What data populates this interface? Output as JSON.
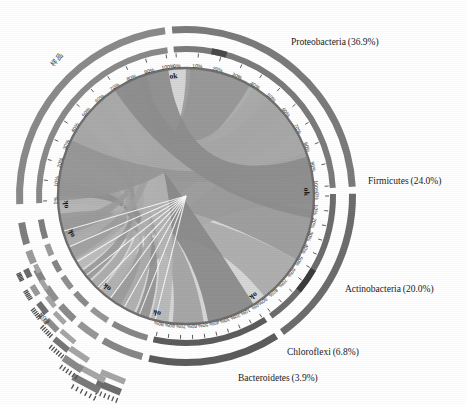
{
  "figure": {
    "type": "chord-circos",
    "title": "",
    "background": "#ffffff",
    "center_x": 186,
    "center_y": 196,
    "radius_outer": 178,
    "radius_ring": 160,
    "radius_chord": 128
  },
  "chart_data": {
    "type": "pie",
    "title": "",
    "subtitle": "",
    "xlabel": "",
    "ylabel": "",
    "legend_position": "outside-right",
    "grid": false,
    "categories": [
      "Proteobacteria",
      "Firmicutes",
      "Actinobacteria",
      "Chloroflexi",
      "Bacteroidetes"
    ],
    "values": [
      36.9,
      24.0,
      20.0,
      6.8,
      3.9
    ],
    "value_unit": "%",
    "axis_tick_labels": [
      "0%",
      "10%",
      "20%",
      "30%",
      "40%",
      "50%",
      "60%",
      "70%",
      "80%",
      "90%",
      "100%"
    ],
    "sector_boundary_marker": "ok",
    "labels": [
      {
        "name": "Proteobacteria",
        "value": 36.9,
        "text": "Proteobacteria (36.9%)",
        "angle_deg": -63,
        "color": "#7d7d7d"
      },
      {
        "name": "Firmicutes",
        "value": 24.0,
        "text": "Firmicutes (24.0%)",
        "angle_deg": 5,
        "color": "#6a6a6a"
      },
      {
        "name": "Actinobacteria",
        "value": 20.0,
        "text": "Actinobacteria (20.0%)",
        "angle_deg": 47,
        "color": "#585858"
      },
      {
        "name": "Chloroflexi",
        "value": 6.8,
        "text": "Chloroflexi (6.8%)",
        "angle_deg": 75,
        "color": "#8a8a8a"
      },
      {
        "name": "Bacteroidetes",
        "value": 3.9,
        "text": "Bacteroidetes (3.9%)",
        "angle_deg": 92,
        "color": "#9a9a9a"
      }
    ],
    "minor_sectors_count": 6,
    "chord_fill": "#b4b4b4",
    "chord_fill_dark": "#8e8e8e",
    "ring_fill": "#c9c9c9"
  },
  "sectors": [
    {
      "id": "proteobacteria",
      "label": "Proteobacteria",
      "pct": "36.9%",
      "start_deg": -96,
      "end_deg": -2,
      "ring_color": "#7b7b7b",
      "ok": "ok"
    },
    {
      "id": "firmicutes",
      "label": "Firmicutes",
      "pct": "24.0%",
      "start_deg": -2,
      "end_deg": 56,
      "ring_color": "#6d6d6d",
      "ok": "ok"
    },
    {
      "id": "actinobacteria",
      "label": "Actinobacteria",
      "pct": "20.0%",
      "start_deg": 56,
      "end_deg": 104,
      "ring_color": "#5c5c5c",
      "ok": "ok"
    },
    {
      "id": "chloroflexi",
      "label": "Chloroflexi",
      "pct": "6.8%",
      "start_deg": 104,
      "end_deg": 121,
      "ring_color": "#878787",
      "ok": "ok"
    },
    {
      "id": "bacteroidetes",
      "label": "Bacteroidetes",
      "pct": "3.9%",
      "start_deg": 121,
      "end_deg": 131,
      "ring_color": "#979797",
      "ok": "ok"
    },
    {
      "id": "minor-1",
      "label": "",
      "pct": "",
      "start_deg": 131,
      "end_deg": 140,
      "ring_color": "#8b8b8b",
      "ok": ""
    },
    {
      "id": "minor-2",
      "label": "",
      "pct": "",
      "start_deg": 140,
      "end_deg": 148,
      "ring_color": "#909090",
      "ok": ""
    },
    {
      "id": "minor-3",
      "label": "",
      "pct": "",
      "start_deg": 148,
      "end_deg": 155,
      "ring_color": "#858585",
      "ok": ""
    },
    {
      "id": "minor-4",
      "label": "",
      "pct": "",
      "start_deg": 155,
      "end_deg": 162,
      "ring_color": "#9c9c9c",
      "ok": ""
    },
    {
      "id": "minor-5",
      "label": "",
      "pct": "",
      "start_deg": 162,
      "end_deg": 172,
      "ring_color": "#7f7f7f",
      "ok": "ok"
    },
    {
      "id": "samples-left",
      "label": "",
      "pct": "",
      "start_deg": 176,
      "end_deg": 264,
      "ring_color": "#8a8a8a",
      "ok": "ok"
    }
  ],
  "side_labels": {
    "upper_left": "样品",
    "lower_left": "群落"
  },
  "tick_sets": {
    "full": [
      "0%",
      "10%",
      "20%",
      "30%",
      "40%",
      "50%",
      "60%",
      "70%",
      "80%",
      "90%",
      "100%"
    ],
    "short": [
      "0%",
      "10%",
      "20%",
      "30%",
      "40%",
      "50%",
      "60%",
      "70%",
      "80%",
      "90%"
    ]
  }
}
